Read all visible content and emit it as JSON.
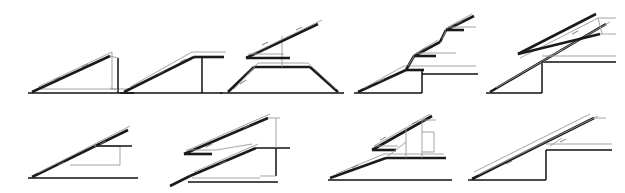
{
  "figure": {
    "background_color": "#ffffff",
    "ink_colors": {
      "truss_thick": "#1a1a1a",
      "structure": "#111111",
      "handrail_thin": "#9a9a9a",
      "tick": "#6e6e6e"
    },
    "rows": 2,
    "panel_count": 9,
    "drawing_style": "technical-line-drawing"
  },
  "panels": [
    {
      "id": "panel-1",
      "row": "top",
      "index": 1,
      "name": "single-flight-escalator-with-vertical-end-support",
      "description": "Single inclined truss rising left to right, closed right side by a tall vertical member, horizontal base slab below",
      "elements": [
        "incline-truss",
        "handrail-line",
        "vertical-support",
        "floor-slab",
        "direction-tick"
      ]
    },
    {
      "id": "panel-2",
      "row": "top",
      "index": 2,
      "name": "single-flight-escalator-with-top-landing",
      "description": "Inclined truss terminating in a horizontal top landing that extends right, supported by a vertical column",
      "elements": [
        "incline-truss",
        "handrail-line",
        "top-landing",
        "vertical-support",
        "floor-line",
        "direction-tick"
      ]
    },
    {
      "id": "panel-3",
      "row": "top",
      "index": 3,
      "name": "bridge-trapezoid-with-suspended-incline",
      "description": "Trapezoidal bridge deck over a floor line, carrying a suspended inclined truss above on a central vertical post",
      "elements": [
        "trapezoid-deck",
        "floor-line",
        "center-post",
        "suspended-incline-truss",
        "handrail-line",
        "direction-tick"
      ]
    },
    {
      "id": "panel-4",
      "row": "top",
      "index": 4,
      "name": "three-flight-stacked-escalator",
      "description": "Three stacked inclined flights joined by intermediate landings, each landing extending a horizontal floor line to the right, with a vertical drop at the lowest landing",
      "elements": [
        "incline-truss-lower",
        "incline-truss-middle",
        "incline-truss-upper",
        "landing-lines",
        "vertical-drop",
        "floor-line",
        "direction-ticks"
      ]
    },
    {
      "id": "panel-5",
      "row": "top",
      "index": 5,
      "name": "long-incline-with-parallel-return-truss",
      "description": "Long inclined truss with a narrow elongated parallel return loop above, stepped platform at the lower right and floor lines",
      "elements": [
        "incline-truss",
        "return-loop-truss",
        "handrail-line",
        "step-platform",
        "floor-line",
        "direction-tick"
      ]
    },
    {
      "id": "panel-6",
      "row": "bottom",
      "index": 6,
      "name": "incline-over-rectangular-pit-frame",
      "description": "Inclined truss crossing a thin rectangular frame below right, long horizontal base floor line",
      "elements": [
        "incline-truss",
        "handrail-line",
        "rectangular-frame",
        "landing-line",
        "floor-line",
        "direction-tick"
      ]
    },
    {
      "id": "panel-7",
      "row": "bottom",
      "index": 7,
      "name": "two-parallel-stacked-inclines-with-right-supports",
      "description": "Two parallel inclined flights stacked one above the other, tied to vertical supports at the right, lower flight starting from a short ground ramp",
      "elements": [
        "incline-truss-lower",
        "incline-truss-upper",
        "handrail-lines",
        "vertical-supports",
        "diagonal-brace",
        "landing-line",
        "floor-line",
        "direction-ticks"
      ]
    },
    {
      "id": "panel-8",
      "row": "bottom",
      "index": 8,
      "name": "incline-to-landing-with-upper-flight-and-stepped-support",
      "description": "Lower incline reaching a horizontal landing, upper incline above tied to vertical posts and a small stepped structure at the right",
      "elements": [
        "incline-truss-lower",
        "incline-truss-upper",
        "landing-deck",
        "vertical-posts",
        "stepped-structure",
        "floor-line",
        "direction-ticks"
      ]
    },
    {
      "id": "panel-9",
      "row": "bottom",
      "index": 9,
      "name": "long-incline-with-step-platform-and-handrails",
      "description": "Long inclined truss with thin parallel handrail lines, a raised step platform at the lower right and horizontal floor lines",
      "elements": [
        "incline-truss",
        "handrail-lines",
        "step-platform",
        "floor-line",
        "direction-tick"
      ]
    }
  ]
}
